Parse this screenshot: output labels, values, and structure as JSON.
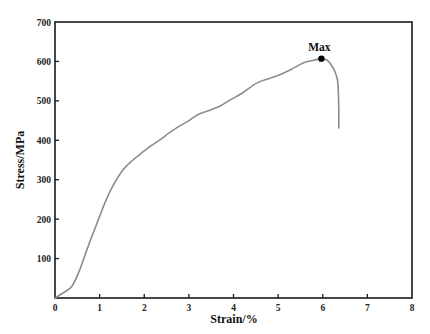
{
  "chart_data": {
    "type": "line",
    "title": "",
    "xlabel": "Strain/%",
    "ylabel": "Stress/MPa",
    "xlim": [
      0,
      8
    ],
    "ylim": [
      0,
      700
    ],
    "xticks": [
      0,
      1,
      2,
      3,
      4,
      5,
      6,
      7,
      8
    ],
    "yticks": [
      100,
      200,
      300,
      400,
      500,
      600,
      700
    ],
    "ytick_labels_shown": [
      "100",
      "200",
      "300",
      "400",
      "500",
      "600",
      "700"
    ],
    "xtick_labels_shown": [
      "0",
      "1",
      "2",
      "3",
      "4",
      "5",
      "6",
      "7",
      "8"
    ],
    "grid": false,
    "legend": null,
    "series": [
      {
        "name": "stress-strain",
        "color": "#8c8c8c",
        "x": [
          0,
          0.2,
          0.38,
          0.55,
          0.72,
          0.88,
          1.0,
          1.12,
          1.3,
          1.53,
          1.75,
          1.98,
          2.15,
          2.35,
          2.55,
          2.76,
          3.0,
          3.2,
          3.48,
          3.7,
          3.92,
          4.2,
          4.52,
          4.8,
          5.04,
          5.3,
          5.56,
          5.8,
          5.97,
          6.1,
          6.19,
          6.27,
          6.33,
          6.35,
          6.36,
          6.36
        ],
        "y": [
          0,
          14,
          30,
          70,
          124,
          172,
          207,
          242,
          285,
          326,
          350,
          371,
          386,
          401,
          418,
          434,
          450,
          465,
          477,
          487,
          502,
          520,
          545,
          557,
          566,
          580,
          596,
          603,
          607,
          603,
          591,
          575,
          553,
          520,
          470,
          431
        ]
      }
    ],
    "annotations": [
      {
        "text": "Max",
        "x": 5.97,
        "y": 607,
        "marker": "filled-circle"
      }
    ]
  },
  "labels": {
    "xlabel": "Strain/%",
    "ylabel": "Stress/MPa",
    "max_annotation": "Max"
  }
}
